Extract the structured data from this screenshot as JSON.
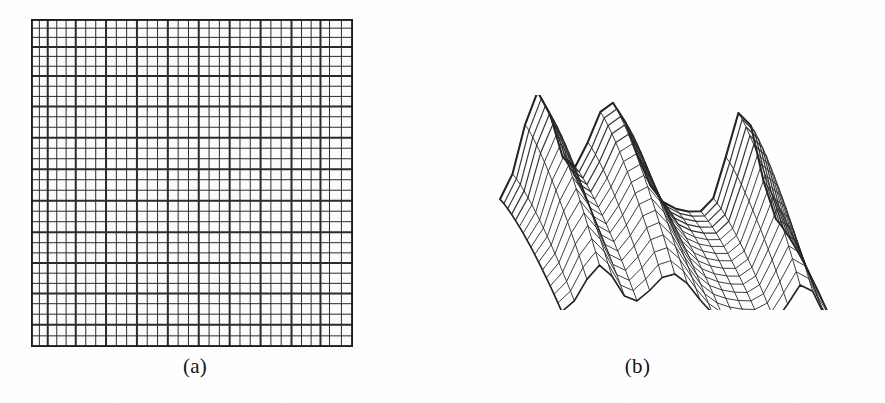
{
  "figure": {
    "background_color": "#fefefe",
    "ink_color": "#2a2a2a",
    "panels": [
      {
        "id": "a",
        "caption": "(a)",
        "kind": "2d-adaptive-mesh",
        "description": "Two-dimensional graded computational mesh on a square domain"
      },
      {
        "id": "b",
        "caption": "(b)",
        "kind": "3d-wireframe-surface",
        "description": "Three-dimensional wireframe surface plot of the computed solution"
      }
    ]
  },
  "chart_data": [
    {
      "type": "heatmap",
      "panel": "a",
      "title": "(a)",
      "xlabel": "",
      "ylabel": "",
      "grid": true,
      "legend": "none",
      "mesh": {
        "style": "structured graded quadrilateral mesh",
        "columns": 32,
        "rows": 32,
        "domain_x": [
          0,
          1
        ],
        "domain_y": [
          0,
          1
        ],
        "line_color": "#2b2b2b",
        "cell_fill": "#fbfbfb",
        "border_color": "#1f1f1f",
        "thin_line_width": 1.0,
        "thick_line_width": 2.0,
        "thick_column_indices": [
          0,
          2,
          5,
          8,
          11,
          14,
          17,
          20,
          23,
          26,
          29,
          32
        ],
        "thick_row_indices": [
          0,
          3,
          6,
          9,
          12,
          15,
          18,
          21,
          24,
          27,
          30,
          32
        ],
        "x_fractions": [
          0.0,
          0.026,
          0.052,
          0.08,
          0.109,
          0.139,
          0.17,
          0.201,
          0.233,
          0.265,
          0.297,
          0.329,
          0.361,
          0.393,
          0.425,
          0.457,
          0.489,
          0.521,
          0.553,
          0.585,
          0.617,
          0.649,
          0.681,
          0.713,
          0.745,
          0.777,
          0.809,
          0.84,
          0.87,
          0.899,
          0.927,
          0.964,
          1.0
        ],
        "y_fractions": [
          0.0,
          0.028,
          0.056,
          0.085,
          0.114,
          0.144,
          0.174,
          0.205,
          0.236,
          0.267,
          0.298,
          0.33,
          0.362,
          0.394,
          0.426,
          0.458,
          0.49,
          0.522,
          0.554,
          0.586,
          0.618,
          0.65,
          0.682,
          0.713,
          0.744,
          0.775,
          0.806,
          0.837,
          0.868,
          0.9,
          0.932,
          0.966,
          1.0
        ]
      }
    },
    {
      "type": "line",
      "panel": "b",
      "title": "(b)",
      "xlabel": "",
      "ylabel": "",
      "zlabel": "",
      "grid": false,
      "legend": "none",
      "surface": {
        "style": "wireframe mesh surface",
        "nx": 22,
        "ny": 16,
        "domain_x": [
          0,
          1
        ],
        "domain_y": [
          0,
          1
        ],
        "zlim": [
          -0.15,
          1.0
        ],
        "line_color": "#262626",
        "wire_width": 1.0,
        "projection": "axonometric",
        "elevation_deg": 22,
        "azimuth_deg": -48,
        "features": [
          {
            "name": "left-peak",
            "x": 0.14,
            "y": 0.55,
            "z": 1.0
          },
          {
            "name": "mid-ridge",
            "x": 0.42,
            "y": 0.5,
            "z": 0.92
          },
          {
            "name": "valley",
            "x": 0.66,
            "y": 0.5,
            "z": 0.34
          },
          {
            "name": "right-peak",
            "x": 0.88,
            "y": 0.48,
            "z": 0.97
          },
          {
            "name": "front-corner-dip",
            "x": 1.0,
            "y": 0.0,
            "z": -0.12
          }
        ],
        "peaks": 2,
        "valleys": 1
      }
    }
  ]
}
